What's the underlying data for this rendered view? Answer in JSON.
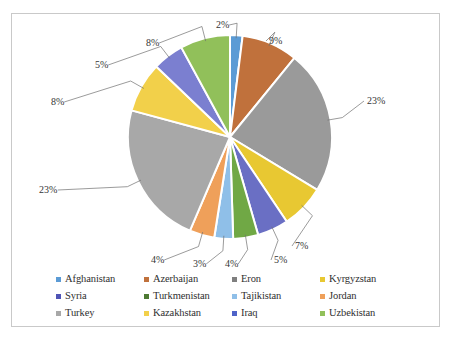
{
  "chart_data": {
    "type": "pie",
    "title": "",
    "legend_position": "bottom",
    "categories": [
      "Afghanistan",
      "Azerbaijan",
      "Eron",
      "Kyrgyzstan",
      "Syria",
      "Turkmenistan",
      "Tajikistan",
      "Jordan",
      "Turkey",
      "Kazakhstan",
      "Iraq",
      "Uzbekistan"
    ],
    "values": [
      2,
      9,
      23,
      7,
      5,
      4,
      3,
      4,
      23,
      8,
      5,
      8
    ],
    "value_labels": [
      "2%",
      "9%",
      "23%",
      "7%",
      "5%",
      "4%",
      "3%",
      "4%",
      "23%",
      "8%",
      "5%",
      "8%"
    ],
    "colors": [
      "#5b9bd5",
      "#c0713c",
      "#9a9a9a",
      "#e8c832",
      "#6a6fc4",
      "#70a845",
      "#8fbfe8",
      "#efa05a",
      "#a8a8a8",
      "#f2d04a",
      "#7b7fd0",
      "#91c05a"
    ],
    "start_angle_deg": 0,
    "direction": "clockwise"
  },
  "legend": {
    "rows": [
      [
        {
          "label": "Afghanistan",
          "color": "#5b9bd5"
        },
        {
          "label": "Azerbaijan",
          "color": "#c0713c"
        },
        {
          "label": "Eron",
          "color": "#7f7f7f"
        },
        {
          "label": "Kyrgyzstan",
          "color": "#e8c832"
        }
      ],
      [
        {
          "label": "Syria",
          "color": "#4f54b5"
        },
        {
          "label": "Turkmenistan",
          "color": "#4e7a33"
        },
        {
          "label": "Tajikistan",
          "color": "#8fbfe8"
        },
        {
          "label": "Jordan",
          "color": "#efa05a"
        }
      ],
      [
        {
          "label": "Turkey",
          "color": "#a8a8a8"
        },
        {
          "label": "Kazakhstan",
          "color": "#f2d04a"
        },
        {
          "label": "Iraq",
          "color": "#4f63c8"
        },
        {
          "label": "Uzbekistan",
          "color": "#91c05a"
        }
      ]
    ]
  },
  "callouts": [
    {
      "name": "afghanistan",
      "text": "2%",
      "x": 204,
      "y": 6
    },
    {
      "name": "azerbaijan",
      "text": "9%",
      "x": 257,
      "y": 22
    },
    {
      "name": "eron",
      "text": "23%",
      "x": 355,
      "y": 82
    },
    {
      "name": "kyrgyzstan",
      "text": "7%",
      "x": 283,
      "y": 227
    },
    {
      "name": "syria",
      "text": "5%",
      "x": 262,
      "y": 241
    },
    {
      "name": "turkmenistan",
      "text": "4%",
      "x": 213,
      "y": 245
    },
    {
      "name": "tajikistan",
      "text": "3%",
      "x": 181,
      "y": 245
    },
    {
      "name": "jordan",
      "text": "4%",
      "x": 139,
      "y": 241
    },
    {
      "name": "turkey",
      "text": "23%",
      "x": 27,
      "y": 171
    },
    {
      "name": "kazakhstan",
      "text": "8%",
      "x": 39,
      "y": 83
    },
    {
      "name": "iraq",
      "text": "5%",
      "x": 83,
      "y": 46
    },
    {
      "name": "uzbekistan",
      "text": "8%",
      "x": 134,
      "y": 24
    }
  ]
}
